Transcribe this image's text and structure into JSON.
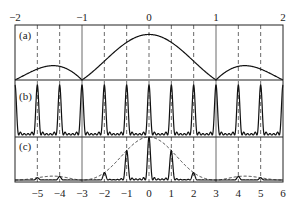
{
  "figure": {
    "panels": [
      {
        "id": "a",
        "label": "(a)",
        "description": "Single-slit envelope function"
      },
      {
        "id": "b",
        "label": "(b)",
        "description": "Multi-slit interference pattern"
      },
      {
        "id": "c",
        "label": "(c)",
        "description": "Product: interference modulated by envelope"
      }
    ],
    "top_axis": {
      "range": [
        -2,
        2
      ],
      "ticks": [
        -2,
        -1,
        0,
        1,
        2
      ],
      "tick_labels": [
        "-2",
        "-1",
        "0",
        "1",
        "2"
      ]
    },
    "bottom_axis": {
      "range": [
        -6,
        6
      ],
      "ticks": [
        -5,
        -4,
        -3,
        -2,
        -1,
        0,
        1,
        2,
        3,
        4,
        5,
        6
      ],
      "tick_labels": [
        "-5",
        "-4",
        "-3",
        "-2",
        "-1",
        "0",
        "1",
        "2",
        "3",
        "4",
        "5",
        "6"
      ]
    },
    "vertical_lines": {
      "dashed_at": [
        -5,
        -4,
        -2,
        -1,
        0,
        1,
        2,
        4,
        5
      ],
      "solid_at": [
        -3,
        3
      ]
    }
  },
  "chart_data": {
    "type": "line",
    "title": "",
    "x_units": "bottom axis (interference order); top axis = bottom / 3",
    "envelope": {
      "function": "sinc^2",
      "zeros_bottom_axis": [
        -6,
        -3,
        3,
        6
      ],
      "peak_at": 0,
      "secondary_max_height_fraction": 0.047,
      "series_panel": "a"
    },
    "interference": {
      "principal_maxima_at": [
        -6,
        -5,
        -4,
        -3,
        -2,
        -1,
        0,
        1,
        2,
        3,
        4,
        5,
        6
      ],
      "subsidiary_maxima_between": 4,
      "series_panel": "b"
    },
    "product": {
      "visible_peaks": [
        -5,
        -4,
        -2,
        -1,
        0,
        1,
        2,
        4,
        5
      ],
      "missing_orders": [
        -3,
        3
      ],
      "envelope_dashed": true,
      "series_panel": "c"
    }
  }
}
